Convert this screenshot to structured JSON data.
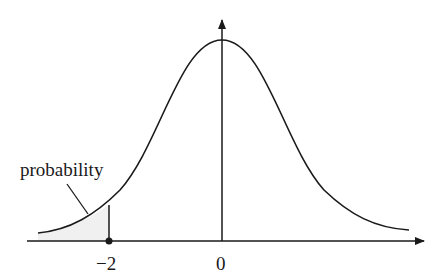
{
  "diagram": {
    "type": "normal-distribution-curve",
    "labels": {
      "probability": "probability",
      "tick_neg2": "−2",
      "tick_zero": "0"
    },
    "shaded_region": "left tail for x < -2",
    "colors": {
      "stroke": "#1a1a1a",
      "shade": "#f2f2f2",
      "background": "#ffffff"
    }
  }
}
